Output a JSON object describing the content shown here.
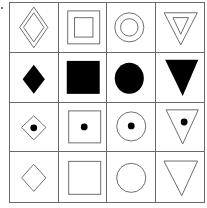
{
  "puzzle": {
    "rows": [
      {
        "row": 1,
        "style": "double-outline",
        "shapes": [
          "diamond",
          "square",
          "circle",
          "triangle-down"
        ]
      },
      {
        "row": 2,
        "style": "filled",
        "shapes": [
          "diamond",
          "square",
          "circle",
          "triangle-down"
        ]
      },
      {
        "row": 3,
        "style": "outline-with-dot",
        "shapes": [
          "diamond",
          "square",
          "circle",
          "triangle-down"
        ]
      },
      {
        "row": 4,
        "style": "outline",
        "shapes": [
          "diamond",
          "square",
          "circle",
          "triangle-down"
        ]
      }
    ],
    "colors": {
      "stroke": "#6a6a6a",
      "fill": "#000000",
      "grid": "#6a6a6a"
    }
  }
}
